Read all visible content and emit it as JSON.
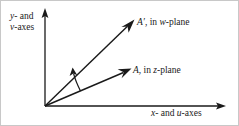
{
  "figure": {
    "background_color": "#ffffff",
    "line_color": "#1a1a1a",
    "border_color": "#c8c8c8",
    "axes": {
      "vertical_label_line1": "y- and",
      "vertical_label_line2": "v-axes",
      "horizontal_label": "x- and u-axes",
      "vertical_label_italic_1": "y",
      "vertical_label_italic_2": "v",
      "horizontal_label_italic_1": "x",
      "horizontal_label_italic_2": "u"
    },
    "vectors": [
      {
        "name": "A-prime",
        "label_symbol": "A′",
        "label_rest": ", in w-plane",
        "plane": "w-plane",
        "origin": [
          44,
          105
        ],
        "tip": [
          133,
          19
        ]
      },
      {
        "name": "A",
        "label_symbol": "A",
        "label_rest": ", in z-plane",
        "plane": "z-plane",
        "origin": [
          44,
          105
        ],
        "tip": [
          130,
          67
        ]
      }
    ],
    "angle_arc": {
      "name": "rotation-angle-arc",
      "description": "curved arrow from vector A to vector A-prime"
    }
  }
}
